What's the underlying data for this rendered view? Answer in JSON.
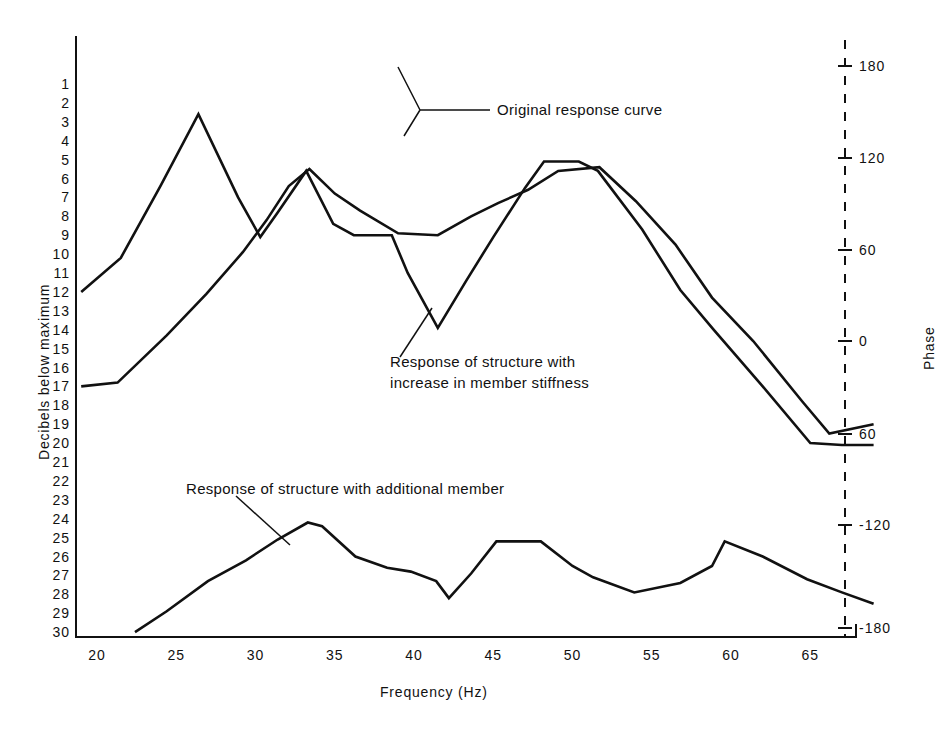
{
  "chart_data": {
    "type": "line",
    "title": "",
    "xlabel": "Frequency (Hz)",
    "ylabel": "Decibels below maximum",
    "y2label": "Phase",
    "xlim": [
      19,
      69
    ],
    "ylim": [
      30,
      0.4
    ],
    "y2lim": [
      -180,
      180
    ],
    "grid": false,
    "legend_position": "inline-annotations",
    "x_ticks": [
      20,
      25,
      30,
      35,
      40,
      45,
      50,
      55,
      60,
      65
    ],
    "y_ticks": [
      1,
      2,
      3,
      4,
      5,
      6,
      7,
      8,
      9,
      10,
      11,
      12,
      13,
      14,
      15,
      16,
      17,
      18,
      19,
      20,
      21,
      22,
      23,
      24,
      25,
      26,
      27,
      28,
      29,
      30
    ],
    "y2_ticks": [
      180,
      120,
      60,
      0,
      -60,
      -120,
      -180
    ],
    "y2_tick_labels": [
      "180",
      "120",
      "60",
      "0",
      "60",
      "-120",
      "-180"
    ],
    "series": [
      {
        "name": "Original response curve",
        "x": [
          19.0,
          21.5,
          24.0,
          26.4,
          28.9,
          30.3,
          31.4,
          33.2,
          34.9,
          36.2,
          38.6,
          39.6,
          41.5,
          43.3,
          45.0,
          47.0,
          48.2,
          50.4,
          51.6,
          54.4,
          56.8,
          58.9,
          62.0,
          65.0,
          67.0,
          69.0
        ],
        "y": [
          12.0,
          10.2,
          6.4,
          2.6,
          7.0,
          9.1,
          7.8,
          5.6,
          8.4,
          9.0,
          9.0,
          11.0,
          13.9,
          11.4,
          9.1,
          6.5,
          5.1,
          5.1,
          5.6,
          8.7,
          11.9,
          14.0,
          17.0,
          20.0,
          20.1,
          20.1
        ]
      },
      {
        "name": "Response of structure with increase in member stiffness",
        "x": [
          19.0,
          21.3,
          24.4,
          26.9,
          29.2,
          30.7,
          32.1,
          33.4,
          35.0,
          36.6,
          39.0,
          41.5,
          43.6,
          45.3,
          47.2,
          49.1,
          51.7,
          54.0,
          56.5,
          58.8,
          61.4,
          64.5,
          66.2,
          69.0
        ],
        "y": [
          17.0,
          16.8,
          14.3,
          12.1,
          9.9,
          8.2,
          6.4,
          5.5,
          6.8,
          7.7,
          8.9,
          9.0,
          8.0,
          7.3,
          6.6,
          5.6,
          5.4,
          7.2,
          9.5,
          12.3,
          14.6,
          17.8,
          19.5,
          19.0
        ]
      },
      {
        "name": "Response of structure with additional member",
        "x": [
          22.4,
          24.4,
          27.0,
          29.4,
          31.4,
          33.3,
          34.2,
          36.3,
          38.3,
          39.8,
          41.4,
          42.2,
          43.6,
          45.2,
          48.0,
          50.0,
          51.3,
          53.9,
          56.8,
          58.8,
          59.6,
          62.0,
          64.8,
          67.0,
          69.0
        ],
        "y": [
          30.0,
          28.9,
          27.3,
          26.2,
          25.1,
          24.2,
          24.4,
          26.0,
          26.6,
          26.8,
          27.3,
          28.2,
          26.9,
          25.2,
          25.2,
          26.5,
          27.1,
          27.9,
          27.4,
          26.5,
          25.2,
          26.0,
          27.2,
          27.9,
          28.5
        ]
      }
    ],
    "annotations": [
      {
        "text": "Original response curve",
        "x_label": 45.6,
        "y_label": 3.4
      },
      {
        "text": "Response of structure with\nincrease in member stiffness",
        "x_label": 41.0,
        "y_label": 16.6
      },
      {
        "text": "Response of structure with additional member",
        "x_label": 28.5,
        "y_label": 23.2
      }
    ],
    "phase_reference_line": {
      "type": "dashed-vertical",
      "x": 68.0
    }
  },
  "axes": {
    "x_title": "Frequency (Hz)",
    "y_title": "Decibels below maximum",
    "y2_title": "Phase"
  },
  "ticks": {
    "x": [
      "20",
      "25",
      "30",
      "35",
      "40",
      "45",
      "50",
      "55",
      "60",
      "65"
    ],
    "y": [
      "1",
      "2",
      "3",
      "4",
      "5",
      "6",
      "7",
      "8",
      "9",
      "10",
      "11",
      "12",
      "13",
      "14",
      "15",
      "16",
      "17",
      "18",
      "19",
      "20",
      "21",
      "22",
      "23",
      "24",
      "25",
      "26",
      "27",
      "28",
      "29",
      "30"
    ],
    "right": [
      "180",
      "120",
      "60",
      "0",
      "60",
      "-120",
      "-180"
    ]
  },
  "annotations": {
    "original": "Original response curve",
    "stiffness_line1": "Response of structure with",
    "stiffness_line2": "increase in member stiffness",
    "additional": "Response of structure with additional member"
  },
  "colors": {
    "ink": "#111111",
    "background": "#ffffff"
  }
}
